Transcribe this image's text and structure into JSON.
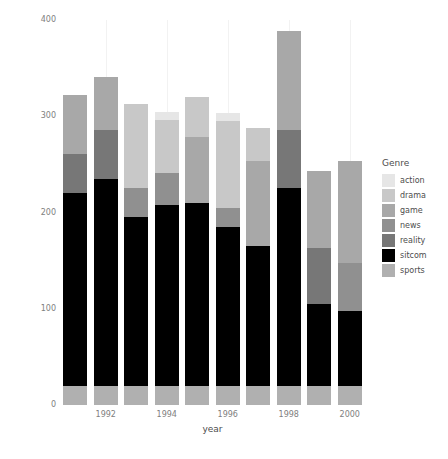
{
  "chart_data": {
    "type": "bar",
    "subtype": "stacked",
    "title": "",
    "xlabel": "year",
    "ylabel": "cumulative ratings points",
    "categories": [
      "1991",
      "1992",
      "1993",
      "1994",
      "1995",
      "1996",
      "1997",
      "1998",
      "1999",
      "2000"
    ],
    "x_tick_labels": [
      "1992",
      "1994",
      "1996",
      "1998",
      "2000"
    ],
    "y_tick_labels": [
      "0",
      "100",
      "200",
      "300",
      "400"
    ],
    "y_ticks": [
      0,
      100,
      200,
      300,
      400
    ],
    "ylim": [
      0,
      400
    ],
    "grid": true,
    "legend_position": "right",
    "legend_title": "Genre",
    "series": [
      {
        "name": "sports",
        "color": "#b0b0b0",
        "values": [
          20,
          20,
          20,
          20,
          20,
          20,
          20,
          20,
          20,
          20
        ]
      },
      {
        "name": "sitcom",
        "color": "#000000",
        "values": [
          200,
          215,
          175,
          188,
          190,
          165,
          145,
          205,
          85,
          78
        ]
      },
      {
        "name": "reality",
        "color": "#777777",
        "values": [
          41,
          51,
          0,
          0,
          0,
          0,
          0,
          61,
          58,
          0
        ]
      },
      {
        "name": "news",
        "color": "#909090",
        "values": [
          0,
          0,
          30,
          33,
          0,
          20,
          0,
          0,
          0,
          50
        ]
      },
      {
        "name": "game",
        "color": "#a8a8a8",
        "values": [
          61,
          55,
          0,
          0,
          68,
          0,
          88,
          103,
          80,
          105
        ]
      },
      {
        "name": "drama",
        "color": "#c8c8c8",
        "values": [
          0,
          0,
          88,
          55,
          42,
          90,
          35,
          0,
          0,
          0
        ]
      },
      {
        "name": "action",
        "color": "#e6e6e6",
        "values": [
          0,
          0,
          0,
          8,
          0,
          8,
          0,
          0,
          0,
          0
        ]
      }
    ],
    "totals": [
      322,
      341,
      313,
      324,
      320,
      303,
      288,
      389,
      243,
      253
    ],
    "stack_order_bottom_to_top": [
      "sports",
      "sitcom",
      "reality",
      "news",
      "game",
      "drama",
      "action"
    ],
    "bar_color_black": "#000000",
    "panel_background": "#ffffff",
    "gridline_color": "#f2f2f2"
  },
  "legend": {
    "title": "Genre",
    "items": [
      {
        "label": "action",
        "color": "#e6e6e6"
      },
      {
        "label": "drama",
        "color": "#c8c8c8"
      },
      {
        "label": "game",
        "color": "#a8a8a8"
      },
      {
        "label": "news",
        "color": "#909090"
      },
      {
        "label": "reality",
        "color": "#777777"
      },
      {
        "label": "sitcom",
        "color": "#000000"
      },
      {
        "label": "sports",
        "color": "#b0b0b0"
      }
    ]
  },
  "axes": {
    "y_title": "cumulative ratings points",
    "x_title": "year"
  }
}
